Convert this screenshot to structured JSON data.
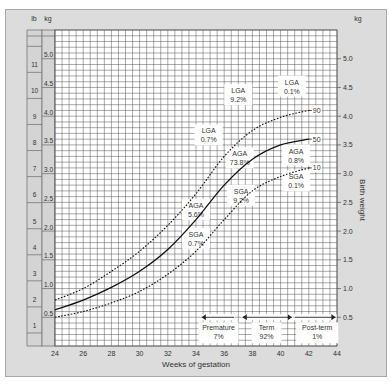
{
  "chart_data": {
    "type": "line",
    "title": "",
    "xlabel": "Weeks of gestation",
    "ylabel": "Birth weight",
    "ylabel_unit_left": "kg",
    "ylabel_unit_right": "kg",
    "lb_label": "lb",
    "xlim": [
      24,
      44
    ],
    "ylim": [
      0,
      5.5
    ],
    "x_ticks": [
      24,
      26,
      28,
      30,
      32,
      34,
      36,
      38,
      40,
      42,
      44
    ],
    "y_ticks_kg": [
      0.5,
      1.0,
      1.5,
      2.0,
      2.5,
      3.0,
      3.5,
      4.0,
      4.5,
      5.0
    ],
    "y_ticks_lb": [
      1,
      2,
      3,
      4,
      5,
      6,
      7,
      8,
      9,
      10,
      11
    ],
    "grid": true,
    "series": [
      {
        "name": "90",
        "style": "dashed",
        "x": [
          24,
          26,
          28,
          30,
          32,
          34,
          36,
          38,
          40,
          42
        ],
        "values": [
          0.8,
          1.0,
          1.3,
          1.65,
          2.1,
          2.65,
          3.3,
          3.75,
          3.98,
          4.1
        ]
      },
      {
        "name": "50",
        "style": "solid",
        "x": [
          24,
          26,
          28,
          30,
          32,
          34,
          36,
          38,
          40,
          42
        ],
        "values": [
          0.63,
          0.8,
          1.02,
          1.3,
          1.68,
          2.2,
          2.8,
          3.25,
          3.5,
          3.6
        ]
      },
      {
        "name": "10",
        "style": "dashed",
        "x": [
          24,
          26,
          28,
          30,
          32,
          34,
          36,
          38,
          40,
          42
        ],
        "values": [
          0.5,
          0.6,
          0.75,
          0.95,
          1.25,
          1.65,
          2.2,
          2.7,
          2.95,
          3.1
        ]
      }
    ],
    "annotations": [
      {
        "text": [
          "LGA",
          "0.7%"
        ],
        "x": 34.9,
        "y": 3.7
      },
      {
        "text": [
          "LGA",
          "9.2%"
        ],
        "x": 37.0,
        "y": 4.4
      },
      {
        "text": [
          "LGA",
          "0.1%"
        ],
        "x": 40.8,
        "y": 4.55
      },
      {
        "text": [
          "AGA",
          "73.8%"
        ],
        "x": 37.1,
        "y": 3.3
      },
      {
        "text": [
          "AGA",
          "0.8%"
        ],
        "x": 41.1,
        "y": 3.35
      },
      {
        "text": [
          "AGA",
          "5.6%"
        ],
        "x": 34.0,
        "y": 2.4
      },
      {
        "text": [
          "SGA",
          "9.2%"
        ],
        "x": 37.2,
        "y": 2.65
      },
      {
        "text": [
          "SGA",
          "0.1%"
        ],
        "x": 41.1,
        "y": 2.9
      },
      {
        "text": [
          "SGA",
          "0.7%"
        ],
        "x": 34.0,
        "y": 1.9
      }
    ],
    "periods": [
      {
        "name": "Premature",
        "pct": "7%",
        "from": 24,
        "to": 37
      },
      {
        "name": "Term",
        "pct": "92%",
        "from": 37,
        "to": 42
      },
      {
        "name": "Post-term",
        "pct": "1%",
        "from": 42,
        "to": 44
      }
    ],
    "curve_labels": [
      "90",
      "50",
      "10"
    ]
  }
}
